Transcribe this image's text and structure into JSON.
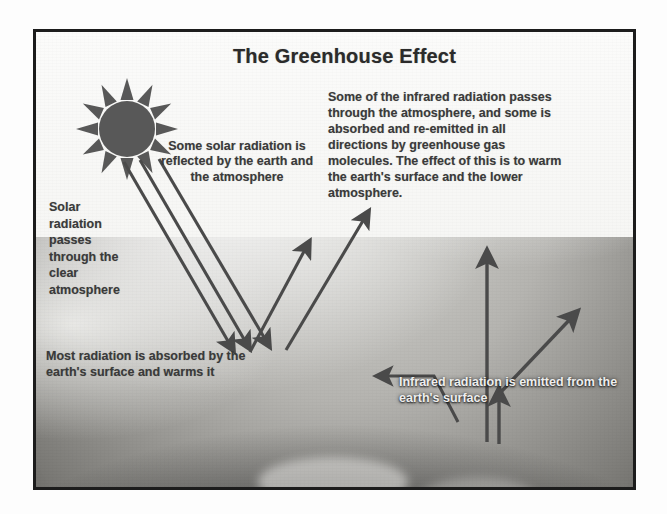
{
  "figure": {
    "title": "The Greenhouse Effect",
    "frame_color": "#1c1c1c",
    "background_color": "#f2f2f0",
    "text_color": "#3a3a3a",
    "light_text_color": "#eeeeee"
  },
  "sun": {
    "icon": "sun-icon",
    "color": "#585858",
    "ray_count": 12
  },
  "earth": {
    "label": "earth-surface-photo",
    "description": "grayscale photograph of the curved earth surface"
  },
  "notes": {
    "solar_reflected": "Some solar radiation is reflected by the earth and the atmosphere",
    "infrared_passes": "Some of the infrared radiation passes through the atmosphere, and some is absorbed and re-emitted in all directions by greenhouse gas molecules. The effect of this is to warm the earth's surface and the lower atmosphere.",
    "solar_passes": "Solar radiation passes through the clear atmosphere",
    "most_absorbed": "Most radiation is absorbed by the earth's surface and warms it",
    "infrared_emitted": "Infrared radiation is emitted from the earth's surface"
  },
  "arrows": {
    "incoming_solar_1": "incoming-solar-ray-arrow",
    "incoming_solar_2": "incoming-solar-ray-arrow",
    "incoming_solar_3": "incoming-solar-ray-arrow",
    "reflected_1": "reflected-radiation-arrow",
    "reflected_2": "reflected-radiation-arrow",
    "infrared_escaping": "infrared-escaping-arrow",
    "infrared_upward": "infrared-upward-arrow",
    "infrared_reemitted": "infrared-reemitted-downward-arrow",
    "color": "#4a4a4a"
  }
}
